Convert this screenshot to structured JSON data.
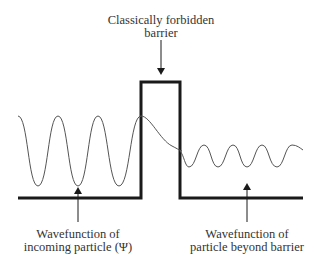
{
  "diagram": {
    "labels": {
      "barrier_line1": "Classically forbidden",
      "barrier_line2": "barrier",
      "incoming_line1": "Wavefunction of",
      "incoming_line2": "incoming particle (Ψ)",
      "transmitted_line1": "Wavefunction of",
      "transmitted_line2": "particle beyond barrier"
    },
    "colors": {
      "potential": "#1a1a1a",
      "wave": "#555555",
      "arrow": "#1a1a1a",
      "text": "#333333"
    }
  }
}
